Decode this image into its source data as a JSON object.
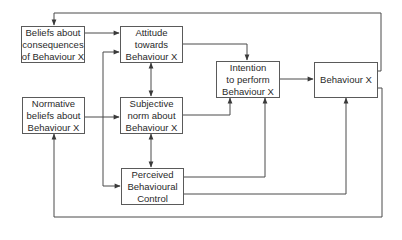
{
  "diagram": {
    "title": "",
    "nodes": {
      "beliefs_consequences": {
        "lines": [
          "Beliefs about",
          "consequences",
          "of Behaviour X"
        ]
      },
      "attitude": {
        "lines": [
          "Attitude",
          "towards",
          "Behaviour X"
        ]
      },
      "normative_beliefs": {
        "lines": [
          "Normative",
          "beliefs about",
          "Behaviour X"
        ]
      },
      "subjective_norm": {
        "lines": [
          "Subjective",
          "norm about",
          "Behaviour X"
        ]
      },
      "perceived_control": {
        "lines": [
          "Perceived",
          "Behavioural",
          "Control"
        ]
      },
      "intention": {
        "lines": [
          "Intention",
          "to perform",
          "Behaviour X"
        ]
      },
      "behaviour": {
        "lines": [
          "Behaviour X"
        ]
      }
    },
    "edges": [
      {
        "from": "Beliefs about consequences of Behaviour X",
        "to": "Attitude towards Behaviour X"
      },
      {
        "from": "Normative beliefs about Behaviour X",
        "to": "Subjective norm about Behaviour X"
      },
      {
        "from": "Attitude towards Behaviour X",
        "to": "Intention to perform Behaviour X"
      },
      {
        "from": "Subjective norm about Behaviour X",
        "to": "Intention to perform Behaviour X"
      },
      {
        "from": "Perceived Behavioural Control",
        "to": "Intention to perform Behaviour X"
      },
      {
        "from": "Perceived Behavioural Control",
        "to": "Behaviour X"
      },
      {
        "from": "Intention to perform Behaviour X",
        "to": "Behaviour X"
      },
      {
        "from": "Attitude towards Behaviour X",
        "to": "Subjective norm about Behaviour X",
        "bidirectional": true
      },
      {
        "from": "Subjective norm about Behaviour X",
        "to": "Perceived Behavioural Control",
        "bidirectional": true
      },
      {
        "from": "Attitude towards Behaviour X",
        "to": "Perceived Behavioural Control",
        "bidirectional": true
      },
      {
        "from": "Behaviour X",
        "to": "Beliefs about consequences of Behaviour X",
        "feedback": true
      },
      {
        "from": "Behaviour X",
        "to": "Normative beliefs about Behaviour X",
        "feedback": true
      }
    ],
    "colors": {
      "line": "#4a4a4a",
      "border": "#5a5a5a",
      "text": "#2a2a2a",
      "background": "#ffffff"
    }
  }
}
